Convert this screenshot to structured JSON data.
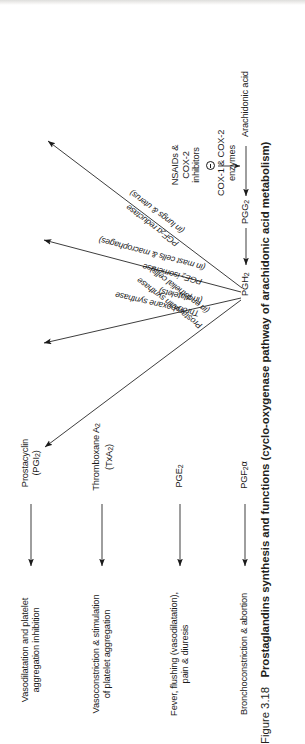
{
  "figure": {
    "number": "Figure 3.18",
    "title": "Prostaglandins synthesis and functions (cyclo-oxygenase pathway of arachidonic acid metabolism)"
  },
  "pathway": {
    "substrate": "Arachidonic acid",
    "intermediate_1": "PGG",
    "intermediate_1_sub": "2",
    "intermediate_2": "PGH",
    "intermediate_2_sub": "2",
    "cox_enzyme_line1": "COX-1 & COX-2",
    "cox_enzyme_line2": "enzymes",
    "inhibitor_line1": "NSAIDs &",
    "inhibitor_line2": "COX-2",
    "inhibitor_line3": "inhibitors",
    "inhibition_symbol": "minus-in-circle"
  },
  "branches": [
    {
      "enzyme_name": "Prostacyclin synthase",
      "enzyme_location": "(in endothelial cells)",
      "product_line1": "Prostacyclin",
      "product_line2": "(PGI",
      "product_line2_sub": "2",
      "product_line2_end": ")",
      "function_line1": "Vasodilatation and platelet",
      "function_line2": "aggregation inhibition"
    },
    {
      "enzyme_name": "Thromboxane synthase",
      "enzyme_location": "(in platelets)",
      "product_line1": "Thromboxane A",
      "product_line1_sub": "2",
      "product_line2": "(TxA",
      "product_line2_sub": "2",
      "product_line2_end": ")",
      "function_line1": "Vasoconstriction & stimulation",
      "function_line2": "of platelet aggregation"
    },
    {
      "enzyme_name": "PGE",
      "enzyme_name_sub": "2",
      "enzyme_name_end": " isomerase",
      "enzyme_location": "(in mast cells & macrophages)",
      "product_line1": "PGE",
      "product_line1_sub": "2",
      "function_line1": "Fever, flushing (vasodilatation),",
      "function_line2": "pain & diuresis"
    },
    {
      "enzyme_name": "PGF",
      "enzyme_name_sub": "2",
      "enzyme_name_end": "α reductase",
      "enzyme_location": "(in lungs & uterus)",
      "product_line1": "PGF",
      "product_line1_sub": "2",
      "product_line1_end": "α",
      "function_line1": "Bronchoconstriction & abortion"
    }
  ],
  "colors": {
    "ink": "#1a1a1a",
    "caption": "#231f20",
    "background": "#ffffff"
  }
}
